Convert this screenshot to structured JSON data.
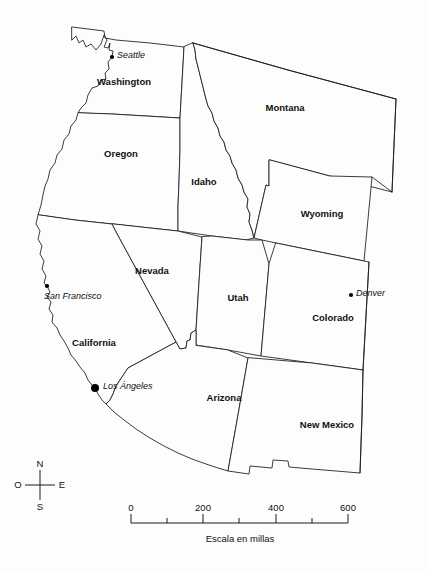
{
  "map": {
    "title_faint": "",
    "background_color": "#fdfdfd",
    "line_color": "#1a1a1a",
    "states": [
      {
        "name": "Washington",
        "label": "Washington",
        "label_x": 124,
        "label_y": 82
      },
      {
        "name": "Oregon",
        "label": "Oregon",
        "label_x": 121,
        "label_y": 154
      },
      {
        "name": "Montana",
        "label": "Montana",
        "label_x": 285,
        "label_y": 108
      },
      {
        "name": "Idaho",
        "label": "Idaho",
        "label_x": 204,
        "label_y": 182
      },
      {
        "name": "Wyoming",
        "label": "Wyoming",
        "label_x": 322,
        "label_y": 214
      },
      {
        "name": "Nevada",
        "label": "Nevada",
        "label_x": 152,
        "label_y": 271
      },
      {
        "name": "Utah",
        "label": "Utah",
        "label_x": 238,
        "label_y": 298
      },
      {
        "name": "Colorado",
        "label": "Colorado",
        "label_x": 333,
        "label_y": 318
      },
      {
        "name": "California",
        "label": "California",
        "label_x": 94,
        "label_y": 343
      },
      {
        "name": "Arizona",
        "label": "Arizona",
        "label_x": 224,
        "label_y": 398
      },
      {
        "name": "New Mexico",
        "label": "New Mexico",
        "label_x": 327,
        "label_y": 425
      }
    ],
    "cities": [
      {
        "name": "Seattle",
        "label": "Seattle",
        "dot_x": 112,
        "dot_y": 57,
        "dot_r": 2.1,
        "label_x": 117,
        "label_y": 56
      },
      {
        "name": "San Francisco",
        "label": "San Francisco",
        "dot_x": 47,
        "dot_y": 286,
        "dot_r": 2.1,
        "label_x": 44,
        "label_y": 297
      },
      {
        "name": "Los Angeles",
        "label": "Los Ángeles",
        "dot_x": 95,
        "dot_y": 388,
        "dot_r": 4.0,
        "label_x": 103,
        "label_y": 387
      },
      {
        "name": "Denver",
        "label": "Denver",
        "dot_x": 351,
        "dot_y": 295,
        "dot_r": 2.1,
        "label_x": 356,
        "label_y": 294
      }
    ]
  },
  "compass": {
    "north": "N",
    "west": "O",
    "east": "E",
    "south": "S",
    "center_x": 40,
    "center_y": 485
  },
  "scale": {
    "caption": "Escala en millas",
    "unit": "millas",
    "tick_labels": [
      "0",
      "200",
      "400",
      "600"
    ],
    "tick_values": [
      0,
      100,
      200,
      300,
      400,
      500,
      600
    ],
    "labeled_values": [
      0,
      200,
      400,
      600
    ],
    "x_start": 131,
    "x_end": 348,
    "baseline_y": 523,
    "label_y": 508,
    "caption_y": 539
  }
}
